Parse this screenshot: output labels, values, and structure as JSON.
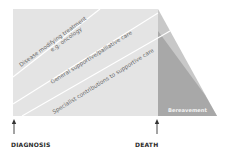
{
  "diagram": {
    "bands": [
      {
        "line1": "Disease modifying treatment",
        "line2": "e.g. oncology"
      },
      {
        "line1": "General supportive/palliative care"
      },
      {
        "line1": "Specialist contributions to supportive care"
      }
    ],
    "bereavement_label": "Bereavement",
    "markers": [
      {
        "label": "DIAGNOSIS"
      },
      {
        "label": "DEATH"
      }
    ],
    "colors": {
      "main_area": "#e4e4e4",
      "upper_triangle": "#c9c9c9",
      "bereavement": "#a9a9a9",
      "divider": "#ffffff",
      "arrow": "#333333"
    }
  }
}
